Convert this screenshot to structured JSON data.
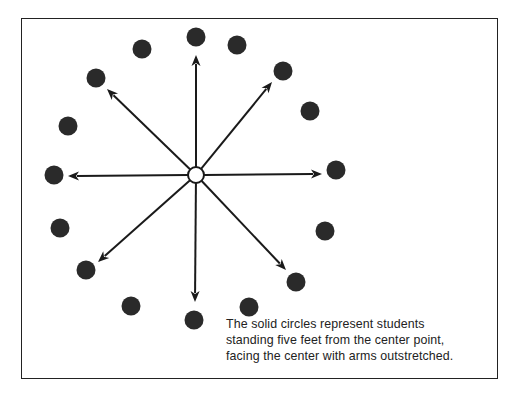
{
  "diagram": {
    "center": {
      "x": 196,
      "y": 175,
      "r": 8,
      "label": "center point"
    },
    "students": [
      {
        "x": 196,
        "y": 37
      },
      {
        "x": 142,
        "y": 49
      },
      {
        "x": 237,
        "y": 45
      },
      {
        "x": 96,
        "y": 78
      },
      {
        "x": 283,
        "y": 71
      },
      {
        "x": 68,
        "y": 126
      },
      {
        "x": 310,
        "y": 111
      },
      {
        "x": 54,
        "y": 175
      },
      {
        "x": 336,
        "y": 170
      },
      {
        "x": 60,
        "y": 228
      },
      {
        "x": 325,
        "y": 231
      },
      {
        "x": 86,
        "y": 270
      },
      {
        "x": 296,
        "y": 282
      },
      {
        "x": 131,
        "y": 306
      },
      {
        "x": 249,
        "y": 307
      },
      {
        "x": 194,
        "y": 320
      }
    ],
    "arrows": [
      {
        "to_x": 196,
        "to_y": 55
      },
      {
        "to_x": 272,
        "to_y": 82
      },
      {
        "to_x": 322,
        "to_y": 174
      },
      {
        "to_x": 286,
        "to_y": 270
      },
      {
        "to_x": 195,
        "to_y": 302
      },
      {
        "to_x": 98,
        "to_y": 262
      },
      {
        "to_x": 68,
        "to_y": 176
      },
      {
        "to_x": 107,
        "to_y": 89
      }
    ],
    "colors": {
      "dot": "#2a2a2a",
      "line": "#1a1a1a",
      "border": "#222222"
    }
  },
  "caption": {
    "line1": "The solid circles represent students",
    "line2": "standing five feet from the center point,",
    "line3": "facing the center with arms outstretched."
  }
}
